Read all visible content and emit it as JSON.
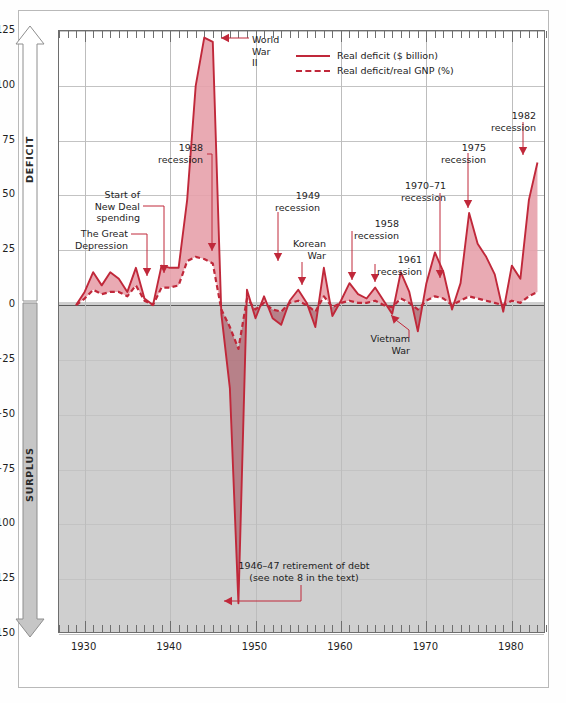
{
  "figure": {
    "left_axis_top_label": "DEFICIT",
    "left_axis_bottom_label": "SURPLUS"
  },
  "legend": {
    "position": "top-right-inside",
    "entries": [
      {
        "label": "Real deficit ($ billion)",
        "style": "solid",
        "color": "#c0283a"
      },
      {
        "label": "Real deficit/real GNP (%)",
        "style": "dashed",
        "color": "#c0283a"
      }
    ]
  },
  "colors": {
    "line": "#c0283a",
    "fill": "#e7a1ab",
    "fill_surplus": "#b06a74",
    "surplus_band": "#cfcfcf",
    "grid": "#c3c3c3",
    "axis": "#6e6e6e",
    "text": "#1d1d1d"
  },
  "annotations": [
    {
      "id": "great-depression",
      "text": "The Great\nDepression",
      "align": "right",
      "x": 62,
      "y": 228,
      "w": 66,
      "elbow": [
        {
          "x": 131,
          "y": 234
        },
        {
          "x": 147,
          "y": 234
        },
        {
          "x": 147,
          "y": 268
        }
      ],
      "arrow": {
        "x": 147,
        "y": 276
      }
    },
    {
      "id": "new-deal",
      "text": "Start of\nNew Deal\nspending",
      "align": "right",
      "x": 74,
      "y": 189,
      "w": 66,
      "elbow": [
        {
          "x": 143,
          "y": 206
        },
        {
          "x": 164,
          "y": 206
        },
        {
          "x": 164,
          "y": 265
        }
      ],
      "arrow": {
        "x": 164,
        "y": 273
      }
    },
    {
      "id": "recession-1938",
      "text": "1938\nrecession",
      "align": "right",
      "x": 145,
      "y": 142,
      "w": 58,
      "elbow": [
        {
          "x": 207,
          "y": 154
        },
        {
          "x": 212,
          "y": 154
        },
        {
          "x": 212,
          "y": 243
        }
      ],
      "arrow": {
        "x": 212,
        "y": 251
      }
    },
    {
      "id": "world-war-ii",
      "text": "World\nWar\nII",
      "align": "left",
      "x": 252,
      "y": 34,
      "w": 40,
      "elbow": [
        {
          "x": 249,
          "y": 38
        },
        {
          "x": 229,
          "y": 38
        }
      ],
      "arrow": {
        "x": 221,
        "y": 38
      }
    },
    {
      "id": "recession-1949",
      "text": "1949\nrecession",
      "align": "right",
      "x": 262,
      "y": 190,
      "w": 58,
      "elbow": [
        {
          "x": 278,
          "y": 212
        },
        {
          "x": 278,
          "y": 253
        }
      ],
      "arrow": {
        "x": 278,
        "y": 261
      }
    },
    {
      "id": "korean-war",
      "text": "Korean\nWar",
      "align": "right",
      "x": 278,
      "y": 238,
      "w": 48,
      "elbow": [
        {
          "x": 302,
          "y": 262
        },
        {
          "x": 302,
          "y": 277
        }
      ],
      "arrow": {
        "x": 302,
        "y": 285
      }
    },
    {
      "id": "recession-1958",
      "text": "1958\nrecession",
      "align": "right",
      "x": 341,
      "y": 218,
      "w": 58,
      "elbow": [
        {
          "x": 352,
          "y": 231
        },
        {
          "x": 352,
          "y": 272
        }
      ],
      "arrow": {
        "x": 352,
        "y": 280
      }
    },
    {
      "id": "recession-1961",
      "text": "1961\nrecession",
      "align": "right",
      "x": 364,
      "y": 254,
      "w": 58,
      "elbow": [
        {
          "x": 375,
          "y": 264
        },
        {
          "x": 375,
          "y": 274
        }
      ],
      "arrow": {
        "x": 375,
        "y": 282
      }
    },
    {
      "id": "recession-1970-71",
      "text": "1970–71\nrecession",
      "align": "right",
      "x": 384,
      "y": 180,
      "w": 62,
      "elbow": [
        {
          "x": 440,
          "y": 193
        },
        {
          "x": 440,
          "y": 270
        }
      ],
      "arrow": {
        "x": 440,
        "y": 278
      }
    },
    {
      "id": "recession-1975",
      "text": "1975\nrecession",
      "align": "right",
      "x": 428,
      "y": 142,
      "w": 58,
      "elbow": [
        {
          "x": 468,
          "y": 153
        },
        {
          "x": 468,
          "y": 200
        }
      ],
      "arrow": {
        "x": 468,
        "y": 208
      }
    },
    {
      "id": "recession-1982",
      "text": "1982\nrecession",
      "align": "right",
      "x": 478,
      "y": 110,
      "w": 58,
      "elbow": [
        {
          "x": 523,
          "y": 122
        },
        {
          "x": 523,
          "y": 147
        }
      ],
      "arrow": {
        "x": 523,
        "y": 155
      }
    },
    {
      "id": "vietnam-war",
      "text": "Vietnam\nWar",
      "align": "right",
      "x": 362,
      "y": 333,
      "w": 48,
      "elbow": [
        {
          "x": 409,
          "y": 338
        },
        {
          "x": 409,
          "y": 330
        },
        {
          "x": 396,
          "y": 320
        }
      ],
      "arrow": {
        "x": 391,
        "y": 315
      }
    },
    {
      "id": "retirement-of-debt",
      "text": "1946–47 retirement of debt\n(see note 8 in the text)",
      "align": "center",
      "x": 196,
      "y": 560,
      "w": 216,
      "elbow": [
        {
          "x": 301,
          "y": 585
        },
        {
          "x": 301,
          "y": 601
        },
        {
          "x": 232,
          "y": 601
        }
      ],
      "arrow": {
        "x": 224,
        "y": 601
      }
    }
  ],
  "chart_data": {
    "type": "area",
    "title": "",
    "xlabel": "",
    "ylabel": "",
    "xlim": [
      1927,
      1984
    ],
    "ylim": [
      -150,
      125
    ],
    "yticks": [
      125,
      100,
      75,
      50,
      25,
      0,
      -25,
      -50,
      -75,
      -100,
      -125,
      -150
    ],
    "ytick_labels": [
      "125",
      "100",
      "75",
      "50",
      "25",
      "0",
      "−25",
      "−50",
      "−75",
      "−100",
      "−125",
      "−150"
    ],
    "xticks": [
      1930,
      1940,
      1950,
      1960,
      1970,
      1980
    ],
    "xtick_labels": [
      "1930",
      "1940",
      "1950",
      "1960",
      "1970",
      "1980"
    ],
    "minor_xtick_interval": 1,
    "grid": true,
    "legend_position": "upper right (inside)",
    "zero_line": 0,
    "shaded_region_below_zero": true,
    "x": [
      1929,
      1930,
      1931,
      1932,
      1933,
      1934,
      1935,
      1936,
      1937,
      1938,
      1939,
      1940,
      1941,
      1942,
      1943,
      1944,
      1945,
      1946,
      1947,
      1948,
      1949,
      1950,
      1951,
      1952,
      1953,
      1954,
      1955,
      1956,
      1957,
      1958,
      1959,
      1960,
      1961,
      1962,
      1963,
      1964,
      1965,
      1966,
      1967,
      1968,
      1969,
      1970,
      1971,
      1972,
      1973,
      1974,
      1975,
      1976,
      1977,
      1978,
      1979,
      1980,
      1981,
      1982,
      1983
    ],
    "series": [
      {
        "name": "Real deficit ($ billion)",
        "style": "solid",
        "color": "#c0283a",
        "unit": "$ billion",
        "values": [
          0,
          6,
          15,
          9,
          15,
          12,
          6,
          17,
          3,
          0,
          18,
          17,
          17,
          48,
          100,
          122,
          120,
          -4,
          -38,
          -136,
          7,
          -6,
          4,
          -6,
          -9,
          2,
          7,
          1,
          -10,
          17,
          -5,
          2,
          10,
          5,
          3,
          8,
          2,
          -4,
          15,
          6,
          -12,
          10,
          24,
          15,
          -2,
          10,
          42,
          28,
          22,
          14,
          -3,
          18,
          12,
          48,
          65
        ],
        "notes": "Solid crimson line; peaks at ~122 (1944) and ~65 (1983); deepest surplus ~−136 in 1947."
      },
      {
        "name": "Real deficit/real GNP (%)",
        "style": "dashed",
        "color": "#c0283a",
        "unit": "%",
        "values": [
          0,
          3,
          7,
          5,
          6,
          6,
          4,
          9,
          2,
          0,
          8,
          8,
          9,
          20,
          22,
          21,
          19,
          -2,
          -10,
          -20,
          3,
          -2,
          1,
          -2,
          -3,
          1,
          2,
          0,
          -3,
          4,
          -1,
          1,
          2,
          1,
          1,
          2,
          0,
          -1,
          3,
          1,
          -2,
          2,
          4,
          3,
          0,
          2,
          4,
          3,
          2,
          1,
          0,
          2,
          1,
          4,
          6
        ],
        "notes": "Dashed crimson line, smaller amplitude; tracks beneath the solid line."
      }
    ],
    "annotation_events": [
      {
        "label": "The Great Depression",
        "year": 1930
      },
      {
        "label": "Start of New Deal spending",
        "year": 1933
      },
      {
        "label": "1938 recession",
        "year": 1938
      },
      {
        "label": "World War II",
        "year": 1944
      },
      {
        "label": "1946–47 retirement of debt (see note 8 in the text)",
        "year": 1947
      },
      {
        "label": "1949 recession",
        "year": 1949
      },
      {
        "label": "Korean War",
        "year": 1952
      },
      {
        "label": "1958 recession",
        "year": 1958
      },
      {
        "label": "1961 recession",
        "year": 1961
      },
      {
        "label": "Vietnam War",
        "year": 1967
      },
      {
        "label": "1970–71 recession",
        "year": 1971
      },
      {
        "label": "1975 recession",
        "year": 1975
      },
      {
        "label": "1982 recession",
        "year": 1982
      }
    ]
  }
}
